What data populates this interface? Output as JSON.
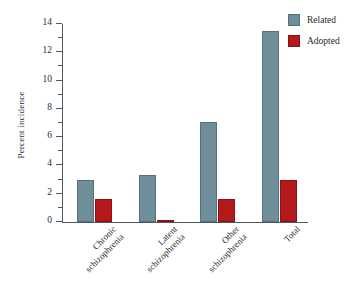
{
  "chart_data": {
    "type": "bar",
    "title": "",
    "subtitle": "",
    "xlabel": "",
    "ylabel": "Percent incidence",
    "ylim": [
      0,
      14
    ],
    "ytick_step": 2,
    "yminor_step": 1,
    "grid": false,
    "legend_position": "top-right",
    "categories": [
      "Chronic\nschizophrenia",
      "Latent\nschizophrenia",
      "Other\nschizophrenia",
      "Total"
    ],
    "ytick_labels": [
      "0",
      "2",
      "4",
      "6",
      "8",
      "10",
      "12",
      "14"
    ],
    "ytick_values": [
      0,
      2,
      4,
      6,
      8,
      10,
      12,
      14
    ],
    "series": [
      {
        "name": "Related",
        "color": "#6e8e99",
        "values": [
          3.0,
          3.3,
          7.1,
          13.5
        ]
      },
      {
        "name": "Adopted",
        "color": "#b4191c",
        "values": [
          1.6,
          0.1,
          1.6,
          3.0
        ]
      }
    ]
  },
  "legend": {
    "items": [
      {
        "label": "Related",
        "color": "#6e8e99"
      },
      {
        "label": "Adopted",
        "color": "#b4191c"
      }
    ]
  },
  "axes": {
    "y_title": "Percent incidence"
  }
}
